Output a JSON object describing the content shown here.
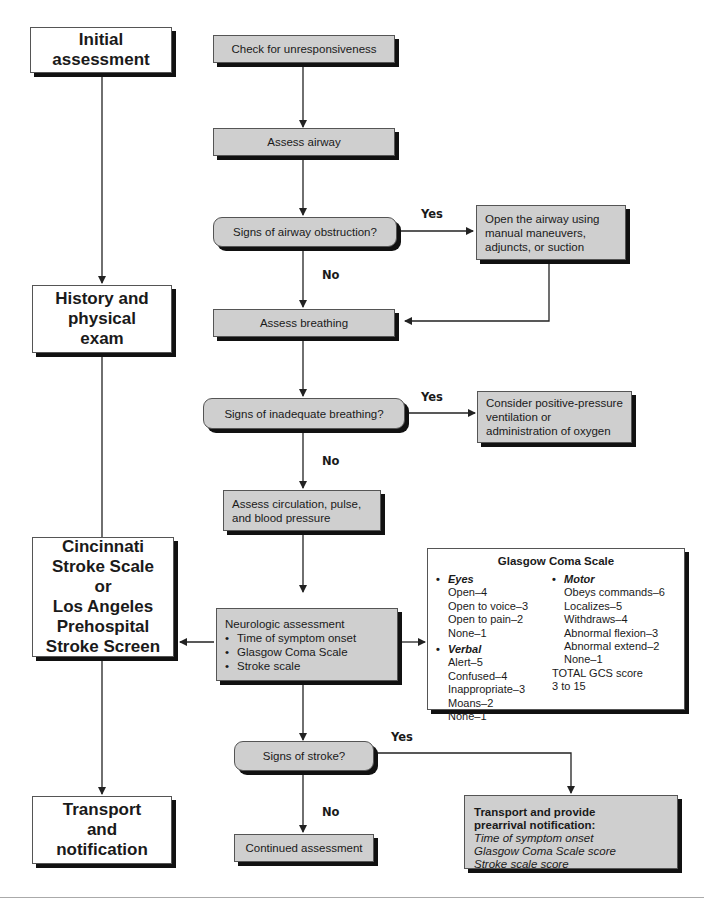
{
  "phases": [
    {
      "id": "initial",
      "label": "Initial\nassessment"
    },
    {
      "id": "history",
      "label": "History and\nphysical\nexam"
    },
    {
      "id": "stroke-scale",
      "label": "Cincinnati\nStroke Scale\nor\nLos Angeles\nPrehospital\nStroke Screen"
    },
    {
      "id": "transport",
      "label": "Transport\nand\nnotification"
    }
  ],
  "steps": {
    "check_unresponsive": "Check for unresponsiveness",
    "assess_airway": "Assess airway",
    "airway_obstruction_q": "Signs of airway obstruction?",
    "open_airway": [
      "Open the airway using",
      "manual maneuvers,",
      "adjuncts, or suction"
    ],
    "assess_breathing": "Assess breathing",
    "inadequate_breathing_q": "Signs of inadequate breathing?",
    "consider_ppv": [
      "Consider positive-pressure",
      "ventilation or",
      "administration of oxygen"
    ],
    "assess_circulation": [
      "Assess circulation, pulse,",
      "and blood pressure"
    ],
    "neuro_assessment": {
      "title": "Neurologic assessment",
      "items": [
        "Time of symptom onset",
        "Glasgow Coma Scale",
        "Stroke scale"
      ]
    },
    "stroke_q": "Signs of stroke?",
    "continued_assessment": "Continued assessment",
    "transport_notify": {
      "title_lines": [
        "Transport and provide",
        "prearrival notification:"
      ],
      "items": [
        "Time of symptom onset",
        "Glasgow Coma Scale score",
        "Stroke scale score"
      ]
    }
  },
  "labels": {
    "yes": "Yes",
    "no": "No"
  },
  "gcs": {
    "title": "Glasgow Coma Scale",
    "eyes": {
      "heading": "Eyes",
      "items": [
        "Open–4",
        "Open to voice–3",
        "Open to pain–2",
        "None–1"
      ]
    },
    "verbal": {
      "heading": "Verbal",
      "items": [
        "Alert–5",
        "Confused–4",
        "Inappropriate–3",
        "Moans–2",
        "None–1"
      ]
    },
    "motor": {
      "heading": "Motor",
      "items": [
        "Obeys commands–6",
        "Localizes–5",
        "Withdraws–4",
        "Abnormal flexion–3",
        "Abnormal extend–2",
        "None–1"
      ]
    },
    "total_label": "TOTAL GCS score",
    "total_range": "3 to 15"
  },
  "bullet": "•",
  "colors": {
    "gray_fill": "#cfcfcf",
    "shadow": "#111111",
    "line": "#222222"
  }
}
